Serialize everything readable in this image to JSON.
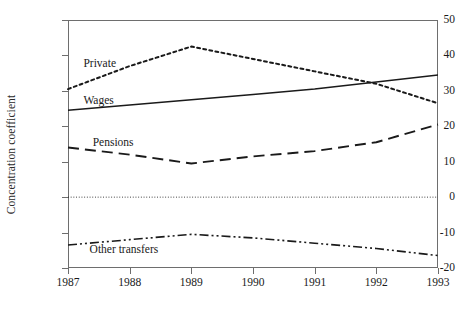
{
  "chart_data": {
    "type": "line",
    "title": "",
    "xlabel": "",
    "ylabel": "Concentration coefficient",
    "x": [
      1987,
      1988,
      1989,
      1990,
      1991,
      1992,
      1993
    ],
    "xlim": [
      1987,
      1993
    ],
    "ylim": [
      -20,
      50
    ],
    "y_ticks": [
      -20,
      -10,
      0,
      10,
      20,
      30,
      40,
      50
    ],
    "x_tick_labels": [
      "1987",
      "1988",
      "1989",
      "1990",
      "1991",
      "1992",
      "1993"
    ],
    "y_tick_labels": [
      "50",
      "40",
      "30",
      "20",
      "10",
      "0",
      "-10",
      "-20"
    ],
    "grid": false,
    "legend": "inline-labels",
    "zero_reference_line": true,
    "series": [
      {
        "name": "Private",
        "label": "Private",
        "style": "dotted",
        "color": "#1a1a1a",
        "values": [
          30.5,
          37.0,
          42.5,
          39.0,
          35.5,
          32.0,
          26.5
        ]
      },
      {
        "name": "Wages",
        "label": "Wages",
        "style": "solid",
        "color": "#1a1a1a",
        "values": [
          24.5,
          26.0,
          27.5,
          29.0,
          30.5,
          32.5,
          34.5
        ]
      },
      {
        "name": "Pensions",
        "label": "Pensions",
        "style": "long-dash",
        "color": "#1a1a1a",
        "values": [
          14.0,
          12.0,
          9.5,
          11.5,
          13.0,
          15.5,
          20.5
        ]
      },
      {
        "name": "Other transfers",
        "label": "Other transfers",
        "style": "dash-dot-dot",
        "color": "#1a1a1a",
        "values": [
          -13.5,
          -12.0,
          -10.5,
          -11.5,
          -13.0,
          -14.5,
          -16.5
        ]
      }
    ],
    "annotations": [
      {
        "text": "Private",
        "x": 1987.25,
        "y": 38.0
      },
      {
        "text": "Wages",
        "x": 1987.25,
        "y": 27.5
      },
      {
        "text": "Pensions",
        "x": 1987.4,
        "y": 15.5
      },
      {
        "text": "Other transfers",
        "x": 1987.35,
        "y": -14.5
      }
    ]
  },
  "axes": {
    "y_title": "Concentration coefficient"
  }
}
